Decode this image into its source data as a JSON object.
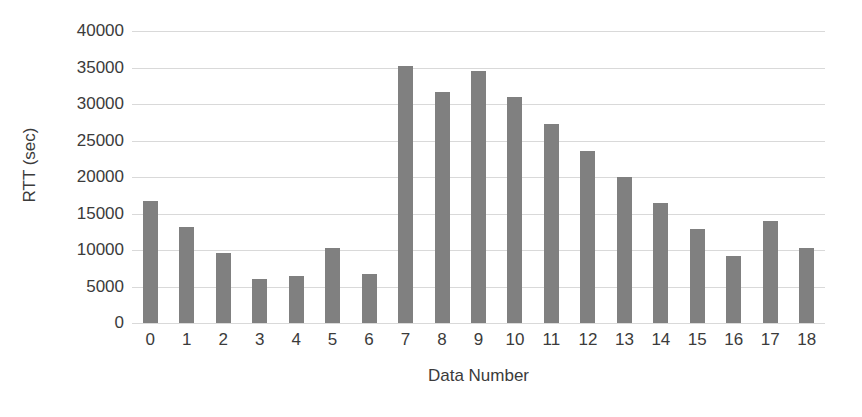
{
  "chart_data": {
    "type": "bar",
    "title": "",
    "xlabel": "Data Number",
    "ylabel": "RTT (sec)",
    "categories": [
      "0",
      "1",
      "2",
      "3",
      "4",
      "5",
      "6",
      "7",
      "8",
      "9",
      "10",
      "11",
      "12",
      "13",
      "14",
      "15",
      "16",
      "17",
      "18"
    ],
    "values": [
      16700,
      13200,
      9550,
      6050,
      6500,
      10250,
      6700,
      35200,
      31600,
      34500,
      30900,
      27300,
      23500,
      20000,
      16400,
      12900,
      9200,
      14000,
      10300
    ],
    "series": [
      {
        "name": "RTT",
        "values": [
          16700,
          13200,
          9550,
          6050,
          6500,
          10250,
          6700,
          35200,
          31600,
          34500,
          30900,
          27300,
          23500,
          20000,
          16400,
          12900,
          9200,
          14000,
          10300
        ]
      }
    ],
    "ylim": [
      0,
      40000
    ],
    "ytick_values": [
      0,
      5000,
      10000,
      15000,
      20000,
      25000,
      30000,
      35000,
      40000
    ],
    "ytick_labels": [
      "0",
      "5000",
      "10000",
      "15000",
      "20000",
      "25000",
      "30000",
      "35000",
      "40000"
    ],
    "grid": true,
    "grid_axis": "y",
    "legend": false,
    "legend_position": "none",
    "bar_color": "#808080",
    "gridline_color": "#d9d9d9",
    "text_color": "#3b3b3b",
    "background_color": "#ffffff"
  }
}
